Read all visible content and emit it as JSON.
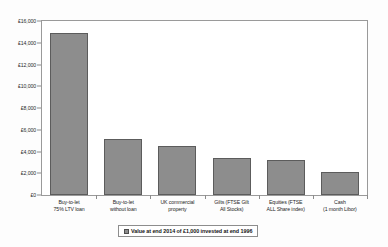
{
  "chart_data": {
    "type": "bar",
    "title": "",
    "subtitle": "",
    "xlabel": "",
    "ylabel": "",
    "ylim": [
      0,
      16000
    ],
    "ytick_step": 2000,
    "grid": false,
    "legend_position": "bottom",
    "currency_symbol": "£",
    "categories": [
      "Buy-to-let\n75% LTV loan",
      "Buy-to-let\nwithout loan",
      "UK commercial\nproperty",
      "Gilts (FTSE Gilt\nAll Stocks)",
      "Equities (FTSE\nALL Share index)",
      "Cash\n(1 month Libor)"
    ],
    "category_lines": [
      [
        "Buy-to-let",
        "75% LTV loan"
      ],
      [
        "Buy-to-let",
        "without loan"
      ],
      [
        "UK commercial",
        "property"
      ],
      [
        "Gilts (FTSE Gilt",
        "All Stocks)"
      ],
      [
        "Equities (FTSE",
        "ALL Share index)"
      ],
      [
        "Cash",
        "(1 month Libor)"
      ]
    ],
    "values": [
      14900,
      5150,
      4500,
      3400,
      3250,
      2100
    ],
    "ytick_labels": [
      "£16,000",
      "£14,000",
      "£12,000",
      "£10,000",
      "£8,000",
      "£6,000",
      "£4,000",
      "£2,000",
      "£0"
    ],
    "ytick_values": [
      16000,
      14000,
      12000,
      10000,
      8000,
      6000,
      4000,
      2000,
      0
    ],
    "series": [
      {
        "name": "Value at end 2014 of £1,000 invested at end 1996",
        "color": "#8d8d8d",
        "border_color": "#5c5c5c",
        "values": [
          14900,
          5150,
          4500,
          3400,
          3250,
          2100
        ]
      }
    ]
  },
  "legend": {
    "label": "Value at end 2014 of £1,000 invested at end 1996",
    "swatch_color": "#8d8d8d"
  },
  "axes": {
    "frame_color": "#9a9a9a",
    "tick_color": "#8c8c8c"
  }
}
